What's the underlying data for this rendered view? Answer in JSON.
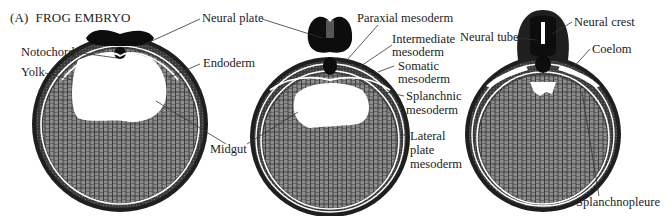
{
  "figure": {
    "panel_label": "(A)",
    "title": "FROG EMBRYO"
  },
  "colors": {
    "ectoderm": "#1a1a1a",
    "mesoderm": "#3a3a3a",
    "yolk_fill": "#8c8c8c",
    "yolk_cell_line": "#2e2e2e",
    "cavity": "#ffffff",
    "leader": "#333333",
    "text": "#222222"
  },
  "embryos": [
    {
      "stage": "early neurula",
      "labels": {
        "neural_plate": "Neural plate",
        "notochord": "Notochord",
        "yolk": "Yolk",
        "endoderm": "Endoderm",
        "midgut": "Midgut"
      }
    },
    {
      "stage": "mid neurula",
      "labels": {
        "paraxial_mesoderm": "Paraxial mesoderm",
        "intermediate_mesoderm_1": "Intermediate",
        "intermediate_mesoderm_2": "mesoderm",
        "somatic_mesoderm_1": "Somatic",
        "somatic_mesoderm_2": "mesoderm",
        "splanchnic_mesoderm_1": "Splanchnic",
        "splanchnic_mesoderm_2": "mesoderm",
        "lateral_plate_mesoderm_1": "Lateral",
        "lateral_plate_mesoderm_2": "plate",
        "lateral_plate_mesoderm_3": "mesoderm"
      }
    },
    {
      "stage": "tailbud",
      "labels": {
        "neural_tube": "Neural tube",
        "neural_crest": "Neural crest",
        "coelom": "Coelom",
        "splanchnopleure": "Splanchnopleure"
      }
    }
  ]
}
